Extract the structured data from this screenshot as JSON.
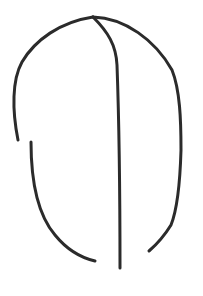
{
  "drawing": {
    "description": "Hand-drawn line sketch of a rounded dome outline split by a vertical center line",
    "background_color": "#ffffff",
    "stroke_color": "#2b2b2b",
    "stroke_width": 3,
    "strokes": [
      {
        "name": "left-upper-arc",
        "d": "M93,17 C60,22 35,40 22,62 C12,80 12,110 18,140"
      },
      {
        "name": "left-lower-arc",
        "d": "M31,142 C31,180 38,215 55,235 C68,251 82,258 95,261"
      },
      {
        "name": "center-line",
        "d": "M93,17 C108,32 116,45 117,65 C119,120 120,200 120,268"
      },
      {
        "name": "right-arc",
        "d": "M93,17 C125,18 155,40 172,70 C180,90 181,120 181,150 C180,185 177,210 171,225 C163,238 156,245 149,251"
      }
    ]
  }
}
